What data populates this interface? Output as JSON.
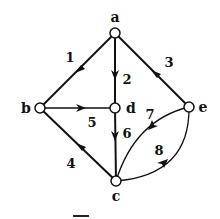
{
  "diagram": {
    "type": "directed-graph",
    "colors": {
      "stroke": "#111111",
      "node_fill": "#ffffff",
      "background": "#ffffff"
    },
    "nodes": [
      {
        "id": "a",
        "label": "a",
        "x": 115,
        "y": 33,
        "lx": 115,
        "ly": 22
      },
      {
        "id": "b",
        "label": "b",
        "x": 40,
        "y": 108,
        "lx": 26,
        "ly": 113
      },
      {
        "id": "d",
        "label": "d",
        "x": 115,
        "y": 108,
        "lx": 130,
        "ly": 113
      },
      {
        "id": "e",
        "label": "e",
        "x": 189,
        "y": 107,
        "lx": 203,
        "ly": 112
      },
      {
        "id": "c",
        "label": "c",
        "x": 116,
        "y": 181,
        "lx": 116,
        "ly": 201
      }
    ],
    "edges": [
      {
        "id": "e1",
        "label": "1",
        "from": "a",
        "to": "b",
        "lx": 70,
        "ly": 62
      },
      {
        "id": "e2",
        "label": "2",
        "from": "a",
        "to": "d",
        "lx": 127,
        "ly": 84
      },
      {
        "id": "e3",
        "label": "3",
        "from": "e",
        "to": "a",
        "lx": 169,
        "ly": 67
      },
      {
        "id": "e4",
        "label": "4",
        "from": "c",
        "to": "b",
        "lx": 71,
        "ly": 168
      },
      {
        "id": "e5",
        "label": "5",
        "from": "b",
        "to": "d",
        "lx": 92,
        "ly": 127
      },
      {
        "id": "e6",
        "label": "6",
        "from": "d",
        "to": "c",
        "lx": 127,
        "ly": 138
      },
      {
        "id": "e7",
        "label": "7",
        "from": "e",
        "to": "c",
        "lx": 150,
        "ly": 119
      },
      {
        "id": "e8",
        "label": "8",
        "from": "c",
        "to": "e",
        "lx": 159,
        "ly": 155
      }
    ]
  }
}
